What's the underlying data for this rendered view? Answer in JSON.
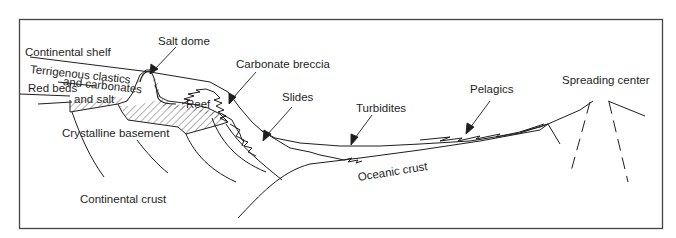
{
  "diagram": {
    "type": "geologic cross-section",
    "line_color": "#1e1e1e",
    "background": "#ffffff"
  },
  "labels": {
    "continental_shelf": "Continental shelf",
    "salt_dome": "Salt dome",
    "terrigenous_line1": "Terrigenous clastics",
    "terrigenous_line2": "and carbonates",
    "red_beds_line1": "Red beds",
    "red_beds_line2": "and salt",
    "reef": "Reef",
    "carbonate_breccia": "Carbonate breccia",
    "slides": "Slides",
    "turbidites": "Turbidites",
    "pelagics": "Pelagics",
    "spreading_center": "Spreading center",
    "crystalline_basement": "Crystalline basement",
    "continental_crust": "Continental crust",
    "oceanic_crust": "Oceanic crust"
  }
}
